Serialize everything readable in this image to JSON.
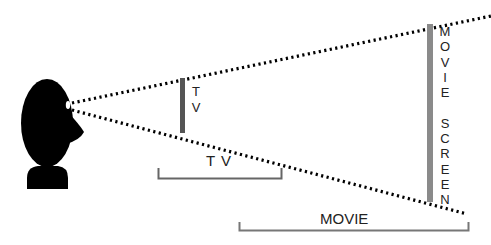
{
  "diagram": {
    "title": "",
    "viewer": {
      "shape": "head-silhouette",
      "color": "#000000"
    },
    "objects": [
      {
        "name": "tv",
        "label_vertical": "T\nV",
        "bracket_label": "T V",
        "color": "#555555"
      },
      {
        "name": "movie-screen",
        "label_vertical": "M\nO\nV\nI\nE\n\nS\nC\nR\nE\nE\nN",
        "bracket_label": "MOVIE",
        "color": "#808080"
      }
    ],
    "sight_lines": {
      "style": "dotted",
      "color": "#000000"
    },
    "bracket_color": "#666666"
  }
}
